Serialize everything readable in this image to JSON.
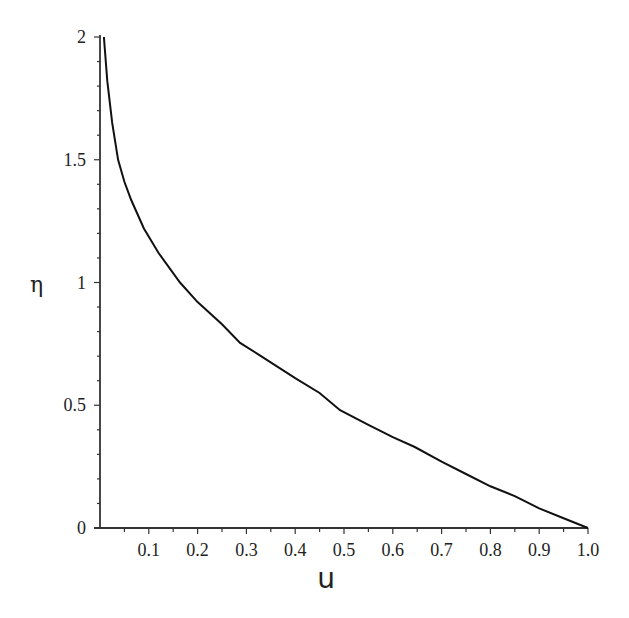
{
  "chart_data": {
    "type": "line",
    "title": "",
    "xlabel": "u",
    "ylabel": "η",
    "xlim": [
      0,
      1.0
    ],
    "ylim": [
      0,
      2
    ],
    "grid": false,
    "legend": null,
    "x_ticks": [
      "0.1",
      "0.2",
      "0.3",
      "0.4",
      "0.5",
      "0.6",
      "0.7",
      "0.8",
      "0.9",
      "1.0"
    ],
    "y_ticks": [
      "0",
      "0.5",
      "1",
      "1.5",
      "2"
    ],
    "series": [
      {
        "name": "η(u)",
        "color": "#111111",
        "x": [
          0.008,
          0.015,
          0.025,
          0.037,
          0.05,
          0.064,
          0.09,
          0.12,
          0.164,
          0.2,
          0.25,
          0.287,
          0.33,
          0.4,
          0.45,
          0.492,
          0.55,
          0.6,
          0.645,
          0.7,
          0.75,
          0.8,
          0.85,
          0.9,
          0.95,
          1.0
        ],
        "y": [
          2.0,
          1.82,
          1.65,
          1.5,
          1.41,
          1.336,
          1.22,
          1.12,
          1.0,
          0.92,
          0.83,
          0.754,
          0.7,
          0.61,
          0.55,
          0.48,
          0.42,
          0.37,
          0.33,
          0.27,
          0.22,
          0.17,
          0.13,
          0.08,
          0.04,
          0.0
        ]
      }
    ]
  },
  "labels": {
    "x_axis": "u",
    "y_axis": "η"
  }
}
